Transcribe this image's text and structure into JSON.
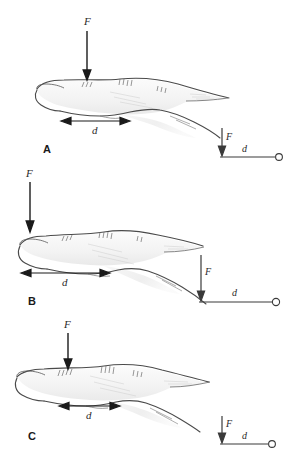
{
  "figure": {
    "background_color": "#ffffff",
    "ink_color": "#2a2a2a",
    "arrow_color": "#1a1a1a",
    "width": 293,
    "height": 463
  },
  "panels": [
    {
      "id": "A",
      "label": "A",
      "force_label": "F",
      "distance_label": "d",
      "description": "Finger in extended posture with force applied near proximal region, short moment arm",
      "schematic": {
        "force_label": "F",
        "distance_label": "d",
        "pivot_icon": "open-circle-pivot",
        "lever_length_px": 62,
        "force_arrow_length_px": 30
      }
    },
    {
      "id": "B",
      "label": "B",
      "force_label": "F",
      "distance_label": "d",
      "description": "Finger in flexed posture with force applied at fingertip, long moment arm",
      "schematic": {
        "force_label": "F",
        "distance_label": "d",
        "pivot_icon": "open-circle-pivot",
        "lever_length_px": 82,
        "force_arrow_length_px": 46
      }
    },
    {
      "id": "C",
      "label": "C",
      "force_label": "F",
      "distance_label": "d",
      "description": "Finger in intermediate posture with force applied mid-segment, short moment arm",
      "schematic": {
        "force_label": "F",
        "distance_label": "d",
        "pivot_icon": "open-circle-pivot",
        "lever_length_px": 52,
        "force_arrow_length_px": 24
      }
    }
  ]
}
